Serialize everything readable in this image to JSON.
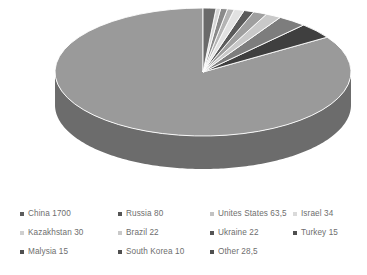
{
  "chart_data": {
    "type": "pie",
    "title": "",
    "subtitle": "",
    "three_d": true,
    "grayscale": true,
    "legend_position": "bottom",
    "legend_columns": 4,
    "start_angle_deg": 0,
    "direction": "counterclockwise",
    "total": 2030.0,
    "labels": [
      "China",
      "Russia",
      "Unites States",
      "Israel",
      "Kazakhstan",
      "Brazil",
      "Ukraine",
      "Turkey",
      "Malysia",
      "South Korea",
      "Other"
    ],
    "values": [
      1700,
      80,
      63.5,
      34,
      30,
      22,
      22,
      15,
      15,
      10,
      28.5
    ],
    "value_texts": [
      "1700",
      "80",
      "63,5",
      "34",
      "30",
      "22",
      "22",
      "15",
      "15",
      "10",
      "28,5"
    ],
    "slice_colors": [
      "#9a9a9a",
      "#3f3f3f",
      "#7d7d7d",
      "#c9c9c9",
      "#9f9f9f",
      "#5a5a5a",
      "#e2e2e2",
      "#b4b4b4",
      "#8a8a8a",
      "#d6d6d6",
      "#6a6a6a"
    ],
    "side_colors": [
      "#6c6c6c",
      "#2c2c2c",
      "#585858",
      "#8e8e8e",
      "#707070",
      "#3f3f3f",
      "#9e9e9e",
      "#7e7e7e",
      "#616161",
      "#969696",
      "#4a4a4a"
    ]
  },
  "legend": {
    "entries": [
      {
        "label": "China 1700",
        "color": "#5c5c5c",
        "row": 0,
        "col": 0
      },
      {
        "label": "Russia 80",
        "color": "#555555",
        "row": 0,
        "col": 1
      },
      {
        "label": "Unites States 63,5",
        "color": "#c2c2c2",
        "row": 0,
        "col": 2
      },
      {
        "label": "Israel 34",
        "color": "#dadada",
        "row": 0,
        "col": 3
      },
      {
        "label": "Kazakhstan 30",
        "color": "#cfcfcf",
        "row": 1,
        "col": 0
      },
      {
        "label": "Brazil 22",
        "color": "#c9c9c9",
        "row": 1,
        "col": 1
      },
      {
        "label": "Ukraine 22",
        "color": "#555555",
        "row": 1,
        "col": 2
      },
      {
        "label": "Turkey 15",
        "color": "#4f4f4f",
        "row": 1,
        "col": 3
      },
      {
        "label": "Malysia 15",
        "color": "#4f4f4f",
        "row": 2,
        "col": 0
      },
      {
        "label": "South Korea 10",
        "color": "#4f4f4f",
        "row": 2,
        "col": 1
      },
      {
        "label": "Other 28,5",
        "color": "#4f4f4f",
        "row": 2,
        "col": 2
      }
    ]
  },
  "style": {
    "background": "#ffffff",
    "text_color": "#6e6e6e"
  }
}
